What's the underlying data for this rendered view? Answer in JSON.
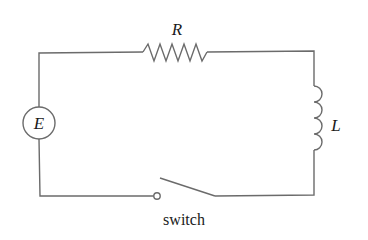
{
  "diagram": {
    "type": "RL circuit schematic",
    "components": {
      "source": {
        "label": "E",
        "kind": "voltage-source"
      },
      "resistor": {
        "label": "R",
        "kind": "resistor"
      },
      "inductor": {
        "label": "L",
        "kind": "inductor"
      },
      "switch": {
        "label": "switch",
        "kind": "switch",
        "state": "open"
      }
    },
    "colors": {
      "wire": "#6b6b6b",
      "text": "#1a1a1a",
      "background": "#ffffff"
    }
  }
}
